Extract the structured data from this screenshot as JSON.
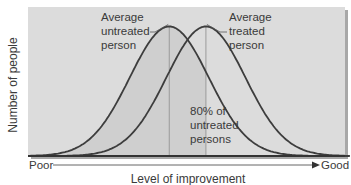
{
  "chart_data": {
    "type": "line",
    "title": "",
    "xlabel": "Level of improvement",
    "ylabel": "Number of people",
    "x_axis": {
      "start_label": "Poor",
      "end_label": "Good"
    },
    "xlim": [
      0,
      100
    ],
    "ylim": [
      0,
      1.15
    ],
    "grid": false,
    "legend": "none",
    "series": [
      {
        "name": "Untreated persons",
        "distribution": "normal",
        "mean": 43,
        "sd": 14,
        "peak": 1.0
      },
      {
        "name": "Treated persons",
        "distribution": "normal",
        "mean": 56,
        "sd": 14,
        "peak": 1.0
      }
    ],
    "markers": [
      {
        "name": "untreated-mean-line",
        "x": 43
      },
      {
        "name": "treated-mean-line",
        "x": 56
      }
    ],
    "annotations": [
      {
        "id": "untreated",
        "lines": [
          "Average",
          "untreated",
          "person"
        ]
      },
      {
        "id": "treated",
        "lines": [
          "Average",
          "treated",
          "person"
        ]
      },
      {
        "id": "percent",
        "lines": [
          "80% of",
          "untreated",
          "persons"
        ]
      }
    ],
    "shaded_region": {
      "series": "Untreated persons",
      "from": 0,
      "to": 56,
      "meaning": "80% of untreated persons fall below the average treated person"
    }
  },
  "colors": {
    "plot_bg": "#dcdcdc",
    "shade": "#cfcfcf",
    "curve": "#3d3d3d",
    "mean_line": "#9a9a9a",
    "axis": "#333333",
    "shadow": "#a8a8a8"
  }
}
